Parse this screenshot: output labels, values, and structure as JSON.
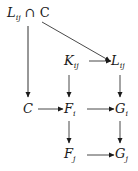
{
  "diagram": {
    "type": "commutative-diagram",
    "nodes": [
      {
        "id": "LijC",
        "base": "L",
        "sub": "ij",
        "suffix": " ∩ C",
        "x": 7,
        "y": 6
      },
      {
        "id": "Kij",
        "base": "K",
        "sub": "ij",
        "suffix": "",
        "x": 64,
        "y": 54
      },
      {
        "id": "Lij",
        "base": "L",
        "sub": "ij",
        "suffix": "",
        "x": 111,
        "y": 54
      },
      {
        "id": "C",
        "base": "C",
        "sub": "",
        "suffix": "",
        "x": 23,
        "y": 102
      },
      {
        "id": "Fi",
        "base": "F",
        "sub": "i",
        "suffix": "",
        "x": 64,
        "y": 102
      },
      {
        "id": "Gi",
        "base": "G",
        "sub": "i",
        "suffix": "",
        "x": 115,
        "y": 102
      },
      {
        "id": "Fj",
        "base": "F",
        "sub": "j",
        "suffix": "",
        "x": 64,
        "y": 147
      },
      {
        "id": "Gj",
        "base": "G",
        "sub": "j",
        "suffix": "",
        "x": 115,
        "y": 147
      }
    ],
    "edges": [
      {
        "from": "LijC",
        "to": "C"
      },
      {
        "from": "LijC",
        "to": "Lij"
      },
      {
        "from": "Kij",
        "to": "Lij"
      },
      {
        "from": "Kij",
        "to": "Fi"
      },
      {
        "from": "Lij",
        "to": "Gi"
      },
      {
        "from": "C",
        "to": "Fi"
      },
      {
        "from": "Fi",
        "to": "Gi"
      },
      {
        "from": "Fi",
        "to": "Fj"
      },
      {
        "from": "Gi",
        "to": "Gj"
      },
      {
        "from": "Fj",
        "to": "Gj"
      }
    ],
    "colors": {
      "ink": "#1a1a1a",
      "background": "#ffffff"
    }
  }
}
